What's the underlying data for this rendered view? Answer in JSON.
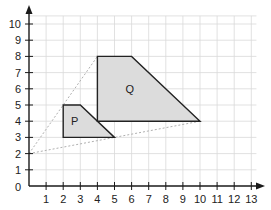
{
  "chart_data": {
    "type": "diagram",
    "title": "",
    "xlabel": "",
    "ylabel": "",
    "xlim": [
      0,
      13
    ],
    "ylim": [
      0,
      10
    ],
    "grid": true,
    "x_ticks": [
      "1",
      "2",
      "3",
      "4",
      "5",
      "6",
      "7",
      "8",
      "9",
      "10",
      "11",
      "12",
      "13"
    ],
    "y_ticks": [
      "0",
      "1",
      "2",
      "3",
      "4",
      "5",
      "6",
      "7",
      "8",
      "9",
      "10"
    ],
    "shapes": [
      {
        "name": "P",
        "vertices": [
          [
            2,
            3
          ],
          [
            2,
            5
          ],
          [
            3,
            5
          ],
          [
            5,
            3
          ]
        ],
        "fill": "#dcdcdc",
        "stroke": "#222222"
      },
      {
        "name": "Q",
        "vertices": [
          [
            4,
            4
          ],
          [
            4,
            8
          ],
          [
            6,
            8
          ],
          [
            10,
            4
          ]
        ],
        "fill": "#dcdcdc",
        "stroke": "#222222"
      }
    ],
    "dashed_lines": [
      {
        "from": [
          0,
          2
        ],
        "to": [
          4,
          8
        ],
        "color": "#b0b0b0"
      },
      {
        "from": [
          0,
          2
        ],
        "to": [
          10,
          4
        ],
        "color": "#b0b0b0"
      }
    ],
    "center_of_enlargement": [
      0,
      2
    ]
  },
  "labels": {
    "origin": "0",
    "shape_p": "P",
    "shape_q": "Q"
  },
  "colors": {
    "grid": "#d9d9d9",
    "axis": "#1a1a1a",
    "shape_fill": "#dcdcdc",
    "dashed": "#b0b0b0"
  }
}
